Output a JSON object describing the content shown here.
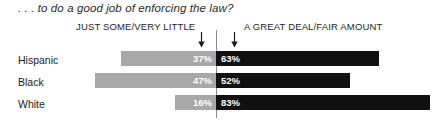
{
  "chart_data": {
    "type": "bar",
    "subtype": "diverging-stacked-bar",
    "title": ". . . to do a good job of enforcing the law?",
    "categories": [
      "Hispanic",
      "Black",
      "White"
    ],
    "series": [
      {
        "name": "JUST SOME/VERY LITTLE",
        "color": "#a8a8a8",
        "side": "left",
        "values": [
          37,
          47,
          16
        ],
        "labels": [
          "37%",
          "47%",
          "16%"
        ]
      },
      {
        "name": "A GREAT DEAL/FAIR AMOUNT",
        "color": "#111111",
        "side": "right",
        "values": [
          63,
          52,
          83
        ],
        "labels": [
          "63%",
          "52%",
          "83%"
        ]
      }
    ],
    "xlabel": "",
    "ylabel": "",
    "xlim": [
      -50,
      90
    ],
    "grid": false,
    "legend_position": "top",
    "annotations": [
      "arrow pointing down to JUST SOME/VERY LITTLE segment",
      "arrow pointing down to A GREAT DEAL/FAIR AMOUNT segment"
    ]
  },
  "header": {
    "left_label": "JUST SOME/VERY LITTLE",
    "right_label": "A GREAT DEAL/FAIR AMOUNT",
    "left_arrow_icon": "arrow-down-icon",
    "right_arrow_icon": "arrow-down-icon"
  },
  "rows": [
    {
      "label": "Hispanic",
      "left_value": "37%",
      "right_value": "63%",
      "left_pct": 37,
      "right_pct": 63
    },
    {
      "label": "Black",
      "left_value": "47%",
      "right_value": "52%",
      "left_pct": 47,
      "right_pct": 52
    },
    {
      "label": "White",
      "left_value": "16%",
      "right_value": "83%",
      "left_pct": 16,
      "right_pct": 83
    }
  ],
  "colors": {
    "left_bar": "#a8a8a8",
    "right_bar": "#111111",
    "divider": "#8a8a8a",
    "text": "#1c1c1c",
    "bar_label_text": "#ffffff",
    "background": "#ffffff"
  },
  "layout": {
    "zero_x": 216,
    "px_per_pct": 2.58
  }
}
